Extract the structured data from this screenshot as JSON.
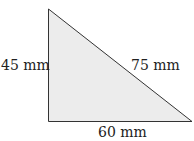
{
  "diagram": {
    "type": "right-triangle",
    "fill_color": "#ececec",
    "stroke_color": "#333333",
    "vertices": {
      "top": [
        48,
        9
      ],
      "bottom_left": [
        48,
        121
      ],
      "bottom_right": [
        192,
        121
      ]
    },
    "labels": {
      "vertical_side": "45 mm",
      "hypotenuse": "75 mm",
      "base": "60 mm"
    }
  }
}
